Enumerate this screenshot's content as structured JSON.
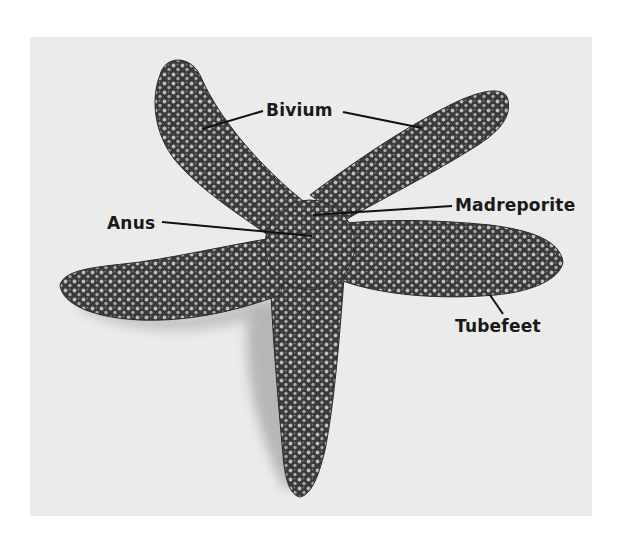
{
  "figure": {
    "background_color": "#ebebeb",
    "page_color": "#ffffff",
    "label_color": "#1a1a1a"
  },
  "labels": {
    "bivium": "Bivium",
    "anus": "Anus",
    "madreporite": "Madreporite",
    "tubefeet": "Tubefeet"
  }
}
